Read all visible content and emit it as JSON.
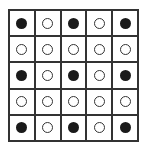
{
  "grid": {
    "rows": 5,
    "cols": 5,
    "cells": [
      [
        "filled",
        "empty",
        "filled",
        "empty",
        "filled"
      ],
      [
        "empty",
        "empty",
        "empty",
        "empty",
        "empty"
      ],
      [
        "filled",
        "empty",
        "filled",
        "empty",
        "filled"
      ],
      [
        "empty",
        "empty",
        "empty",
        "empty",
        "empty"
      ],
      [
        "filled",
        "empty",
        "filled",
        "empty",
        "filled"
      ]
    ]
  },
  "colors": {
    "line": "#333333",
    "filled": "#1a1a1a",
    "background": "#ffffff"
  }
}
